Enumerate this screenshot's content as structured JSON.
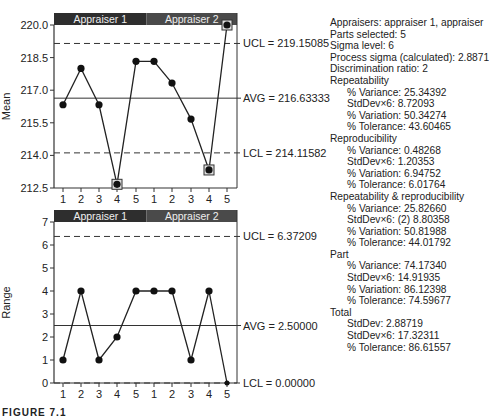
{
  "caption": "FIGURE 7.1",
  "chart_data": [
    {
      "type": "line",
      "title": "Mean chart",
      "ylabel": "Mean",
      "xlabel": "",
      "ylim": [
        212.5,
        220.0
      ],
      "yticks": [
        "220.0",
        "218.5",
        "217.0",
        "215.5",
        "214.0",
        "212.5"
      ],
      "groups": [
        "Appraiser 1",
        "Appraiser 2"
      ],
      "categories": [
        "1",
        "2",
        "3",
        "4",
        "5",
        "1",
        "2",
        "3",
        "4",
        "5"
      ],
      "values": [
        216.33,
        218.0,
        216.33,
        212.67,
        218.33,
        218.33,
        217.33,
        215.67,
        213.33,
        220.0
      ],
      "out_of_control_points": [
        3,
        8,
        9
      ],
      "control_lines": {
        "UCL": {
          "value": 219.15085,
          "label": "UCL = 219.15085",
          "style": "dashed"
        },
        "AVG": {
          "value": 216.63333,
          "label": "AVG = 216.63333",
          "style": "solid"
        },
        "LCL": {
          "value": 214.11582,
          "label": "LCL = 214.11582",
          "style": "dashed"
        }
      },
      "grid": false
    },
    {
      "type": "line",
      "title": "Range chart",
      "ylabel": "Range",
      "xlabel": "",
      "ylim": [
        0,
        7
      ],
      "yticks": [
        "7",
        "6",
        "5",
        "4",
        "3",
        "2",
        "1",
        "0"
      ],
      "groups": [
        "Appraiser 1",
        "Appraiser 2"
      ],
      "categories": [
        "1",
        "2",
        "3",
        "4",
        "5",
        "1",
        "2",
        "3",
        "4",
        "5"
      ],
      "values": [
        1,
        4,
        1,
        2,
        4,
        4,
        4,
        1,
        4,
        0
      ],
      "control_lines": {
        "UCL": {
          "value": 6.37209,
          "label": "UCL = 6.37209",
          "style": "dashed"
        },
        "AVG": {
          "value": 2.5,
          "label": "AVG = 2.50000",
          "style": "solid"
        },
        "LCL": {
          "value": 0.0,
          "label": "LCL = 0.00000",
          "style": "dashed"
        }
      },
      "grid": false
    }
  ],
  "stats": {
    "lines": [
      {
        "text": "Appraisers: appraiser 1, appraiser",
        "indent": false
      },
      {
        "text": "Parts selected: 5",
        "indent": false
      },
      {
        "text": "Sigma level: 6",
        "indent": false
      },
      {
        "text": "Process sigma (calculated): 2.8871",
        "indent": false
      },
      {
        "text": "Discrimination ratio: 2",
        "indent": false
      },
      {
        "text": "Repeatability",
        "indent": false
      },
      {
        "text": "% Variance: 25.34392",
        "indent": true
      },
      {
        "text": "StdDev×6: 8.72093",
        "indent": true
      },
      {
        "text": "% Variation: 50.34274",
        "indent": true
      },
      {
        "text": "% Tolerance: 43.60465",
        "indent": true
      },
      {
        "text": "Reproducibility",
        "indent": false
      },
      {
        "text": "% Variance: 0.48268",
        "indent": true
      },
      {
        "text": "StdDev×6: 1.20353",
        "indent": true
      },
      {
        "text": "% Variation: 6.94752",
        "indent": true
      },
      {
        "text": "% Tolerance: 6.01764",
        "indent": true
      },
      {
        "text": "Repeatability & reproducibility",
        "indent": false
      },
      {
        "text": "% Variance: 25.82660",
        "indent": true
      },
      {
        "text": "StdDev×6: (2) 8.80358",
        "indent": true
      },
      {
        "text": "% Variation: 50.81988",
        "indent": true
      },
      {
        "text": "% Tolerance: 44.01792",
        "indent": true
      },
      {
        "text": "Part",
        "indent": false
      },
      {
        "text": "% Variance: 74.17340",
        "indent": true
      },
      {
        "text": "StdDev×6: 14.91935",
        "indent": true
      },
      {
        "text": "% Variation: 86.12398",
        "indent": true
      },
      {
        "text": "% Tolerance: 74.59677",
        "indent": true
      },
      {
        "text": "Total",
        "indent": false
      },
      {
        "text": "StdDev: 2.88719",
        "indent": true
      },
      {
        "text": "StdDev×6: 17.32311",
        "indent": true
      },
      {
        "text": "% Tolerance: 86.61557",
        "indent": true
      }
    ]
  },
  "colors": {
    "header_dark": "#2e2e2e",
    "header_mid": "#4a4a4a",
    "line": "#222222",
    "axis": "#333333"
  }
}
